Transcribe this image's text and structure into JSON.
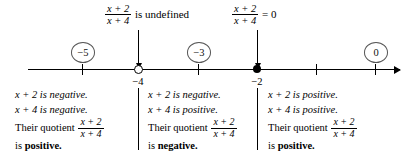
{
  "figure": {
    "expression": {
      "numerator": "x + 2",
      "denominator": "x + 4"
    }
  },
  "annotations": [
    {
      "id": "undefined",
      "numerator": "x + 2",
      "denominator": "x + 4",
      "text": "is undefined",
      "points_to": "-4"
    },
    {
      "id": "zero",
      "numerator": "x + 2",
      "denominator": "x + 4",
      "text": "= 0",
      "points_to": "-2"
    }
  ],
  "number_line": {
    "ticks": [
      {
        "label": "-5",
        "value": -5,
        "marker": "tick"
      },
      {
        "label": "−4",
        "value": -4,
        "marker": "open"
      },
      {
        "label": "-3",
        "value": -3,
        "marker": "tick"
      },
      {
        "label": "−2",
        "value": -2,
        "marker": "closed"
      },
      {
        "label": "-1",
        "value": -1,
        "marker": "tick"
      },
      {
        "label": "0",
        "value": 0,
        "marker": "tick"
      }
    ],
    "axis_labels": {
      "neg_four": "−4",
      "neg_two": "−2"
    },
    "test_values": [
      {
        "label": "−5"
      },
      {
        "label": "−3"
      },
      {
        "label": "0"
      }
    ]
  },
  "cases": [
    {
      "id": "left",
      "line1": "x + 2 is negative.",
      "line2": "x + 4 is negative.",
      "quotient_label": "Their quotient",
      "numerator": "x + 2",
      "denominator": "x + 4",
      "conclusion_prefix": "is ",
      "conclusion": "positive."
    },
    {
      "id": "middle",
      "line1": "x + 2 is negative.",
      "line2": "x + 4 is positive.",
      "quotient_label": "Their quotient",
      "numerator": "x + 2",
      "denominator": "x + 4",
      "conclusion_prefix": "is ",
      "conclusion": "negative."
    },
    {
      "id": "right",
      "line1": "x + 2 is positive.",
      "line2": "x + 4 is positive.",
      "quotient_label": "Their quotient",
      "numerator": "x + 2",
      "denominator": "x + 4",
      "conclusion_prefix": "is ",
      "conclusion": "positive."
    }
  ],
  "colors": {
    "ink": "#000000",
    "circle_outline": "#555555",
    "background": "#ffffff"
  }
}
